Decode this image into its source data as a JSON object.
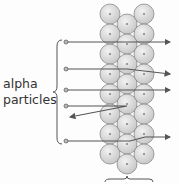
{
  "diagram": {
    "label_line1": "alpha",
    "label_line2": "particles",
    "colors": {
      "circle_fill": "#d9d9d9",
      "circle_stroke": "#8a8a8a",
      "arrow": "#555555",
      "nucleus": "#888888"
    },
    "atom_columns": [
      {
        "x": 110,
        "ys": [
          14,
          34,
          54,
          74,
          94,
          114,
          134,
          154
        ]
      },
      {
        "x": 127,
        "ys": [
          24,
          44,
          64,
          84,
          104,
          124,
          144,
          164
        ]
      },
      {
        "x": 144,
        "ys": [
          14,
          34,
          54,
          74,
          94,
          114,
          134,
          154
        ]
      }
    ],
    "paths": [
      {
        "name": "straight-through",
        "points": "66,42 170,42"
      },
      {
        "name": "slightly-deflected",
        "points": "66,69 127,69 170,74"
      },
      {
        "name": "straight-through",
        "points": "66,90 170,90"
      },
      {
        "name": "reflected-back",
        "points": "66,106 127,106 70,117"
      },
      {
        "name": "slightly-deflected",
        "points": "66,141 130,141 145,137 170,137"
      }
    ]
  }
}
